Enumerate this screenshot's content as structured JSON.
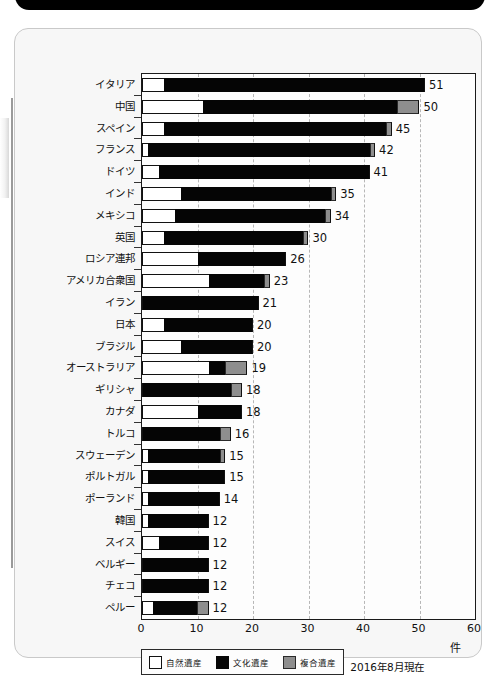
{
  "chart_data": {
    "type": "bar",
    "orientation": "horizontal",
    "stacked": true,
    "title": "",
    "xlabel": "件",
    "ylabel": "",
    "xlim": [
      0,
      60
    ],
    "xticks": [
      0,
      10,
      20,
      30,
      40,
      50,
      60
    ],
    "grid": true,
    "grid_style": "dashed vertical",
    "legend_position": "bottom-left",
    "annotation": "2016年8月現在",
    "categories": [
      "イタリア",
      "中国",
      "スペイン",
      "フランス",
      "ドイツ",
      "インド",
      "メキシコ",
      "英国",
      "ロシア連邦",
      "アメリカ合衆国",
      "イラン",
      "日本",
      "ブラジル",
      "オーストラリア",
      "ギリシャ",
      "カナダ",
      "トルコ",
      "スウェーデン",
      "ポルトガル",
      "ポーランド",
      "韓国",
      "スイス",
      "ベルギー",
      "チェコ",
      "ペルー"
    ],
    "series": [
      {
        "name": "自然遺産",
        "color": "#ffffff",
        "values": [
          4,
          11,
          4,
          1,
          3,
          7,
          6,
          4,
          10,
          12,
          0,
          4,
          7,
          12,
          0,
          10,
          0,
          1,
          1,
          1,
          1,
          3,
          0,
          0,
          2
        ]
      },
      {
        "name": "文化遺産",
        "color": "#050505",
        "values": [
          47,
          35,
          40,
          40,
          38,
          27,
          27,
          25,
          16,
          10,
          21,
          16,
          13,
          3,
          16,
          8,
          14,
          13,
          14,
          13,
          11,
          9,
          12,
          12,
          8
        ]
      },
      {
        "name": "複合遺産",
        "color": "#8e8e8e",
        "values": [
          0,
          4,
          1,
          1,
          0,
          1,
          1,
          1,
          0,
          1,
          0,
          0,
          0,
          4,
          2,
          0,
          2,
          1,
          0,
          0,
          0,
          0,
          0,
          0,
          2
        ]
      }
    ],
    "totals": [
      51,
      50,
      45,
      42,
      41,
      35,
      34,
      30,
      26,
      23,
      21,
      20,
      20,
      19,
      18,
      18,
      16,
      15,
      15,
      14,
      12,
      12,
      12,
      12,
      12
    ]
  },
  "legend": {
    "items": [
      {
        "label": "自然遺産",
        "swatch": "natural"
      },
      {
        "label": "文化遺産",
        "swatch": "cultural"
      },
      {
        "label": "複合遺産",
        "swatch": "mixed"
      }
    ]
  },
  "footer": {
    "as_of": "2016年8月現在",
    "unit": "件"
  }
}
